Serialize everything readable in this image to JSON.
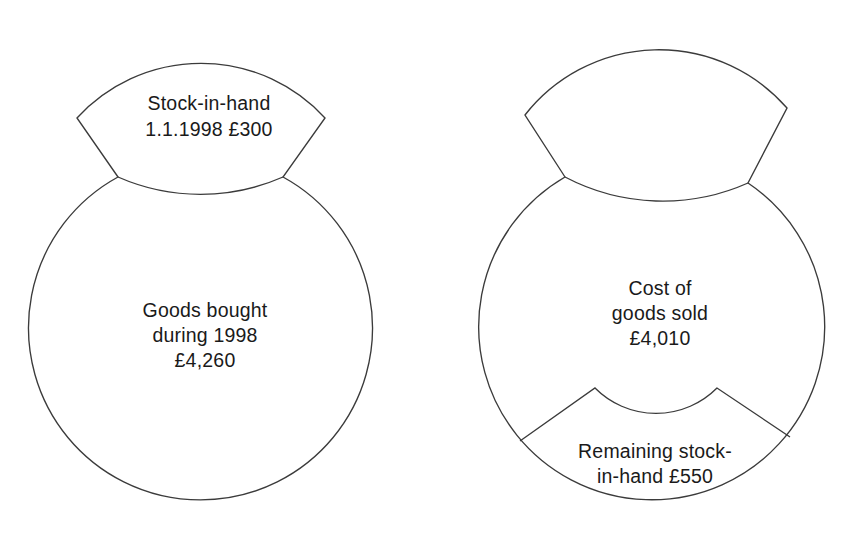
{
  "diagram": {
    "type": "stock-flow-shape-diagram",
    "background_color": "#ffffff",
    "stroke_color": "#3b3b3b",
    "text_color": "#1a1a1a",
    "shapes": [
      {
        "id": "left-shape",
        "name": "opening-stock-and-purchases",
        "segments": [
          {
            "id": "left-upper-lobe",
            "name": "stock-in-hand-segment",
            "lines": [
              "Stock-in-hand",
              "1.1.1998 £300"
            ]
          },
          {
            "id": "left-main-body",
            "name": "goods-bought-segment",
            "lines": [
              "Goods bought",
              "during 1998",
              "£4,260"
            ]
          }
        ]
      },
      {
        "id": "right-shape",
        "name": "cost-of-sales-and-closing-stock",
        "segments": [
          {
            "id": "right-upper-lobe",
            "name": "upper-lobe-segment",
            "lines": []
          },
          {
            "id": "right-main-body",
            "name": "cost-of-goods-sold-segment",
            "lines": [
              "Cost of",
              "goods sold",
              "£4,010"
            ]
          },
          {
            "id": "right-bottom-segment",
            "name": "remaining-stock-segment",
            "lines": [
              "Remaining stock-",
              "in-hand £550"
            ]
          }
        ]
      }
    ]
  },
  "labels": {
    "left_top_line1": "Stock-in-hand",
    "left_top_line2": "1.1.1998 £300",
    "left_body_line1": "Goods bought",
    "left_body_line2": "during 1998",
    "left_body_line3": "£4,260",
    "right_body_line1": "Cost of",
    "right_body_line2": "goods sold",
    "right_body_line3": "£4,010",
    "right_bottom_line1": "Remaining stock-",
    "right_bottom_line2": "in-hand £550"
  },
  "values": {
    "opening_stock": "£300",
    "opening_stock_date": "1.1.1998",
    "goods_bought": "£4,260",
    "goods_bought_year": "1998",
    "cost_of_goods_sold": "£4,010",
    "remaining_stock": "£550"
  }
}
